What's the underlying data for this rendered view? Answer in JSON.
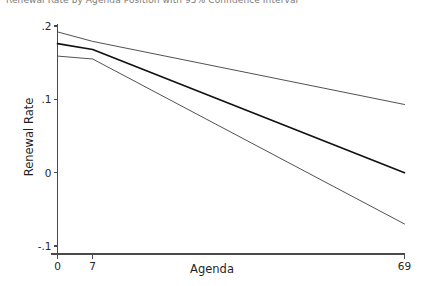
{
  "top_strip_text": "Renewal Rate by Agenda Position with 95% Confidence Interval",
  "chart_data": {
    "type": "line",
    "title": "",
    "xlabel": "Agenda",
    "ylabel": "Renewal Rate",
    "xlim": [
      0,
      69
    ],
    "ylim": [
      -0.1,
      0.2
    ],
    "xticks": [
      0,
      7,
      69
    ],
    "xtick_labels": [
      "0",
      "7",
      "69"
    ],
    "yticks": [
      -0.1,
      0,
      0.1,
      0.2
    ],
    "ytick_labels": [
      "-.1",
      "0",
      ".1",
      ".2"
    ],
    "grid": false,
    "legend": "none",
    "series": [
      {
        "name": "upper-bound",
        "role": "confidence-upper",
        "color": "#3d3d3d",
        "width": 0.9,
        "x": [
          0,
          7,
          69
        ],
        "values": [
          0.192,
          0.179,
          0.093
        ]
      },
      {
        "name": "point-estimate",
        "role": "fitted-line",
        "color": "#111111",
        "width": 1.7,
        "x": [
          0,
          7,
          69
        ],
        "values": [
          0.176,
          0.168,
          0.0
        ]
      },
      {
        "name": "lower-bound",
        "role": "confidence-lower",
        "color": "#3d3d3d",
        "width": 0.9,
        "x": [
          0,
          7,
          69
        ],
        "values": [
          0.159,
          0.155,
          -0.07
        ]
      }
    ]
  }
}
